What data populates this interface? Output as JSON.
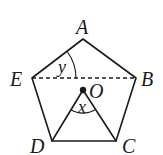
{
  "diagram": {
    "type": "geometry",
    "shape": "regular pentagon",
    "vertices": {
      "A": {
        "label": "A",
        "x": 83,
        "y": 39
      },
      "B": {
        "label": "B",
        "x": 136,
        "y": 78
      },
      "C": {
        "label": "C",
        "x": 116,
        "y": 141
      },
      "D": {
        "label": "D",
        "x": 52,
        "y": 141
      },
      "E": {
        "label": "E",
        "x": 32,
        "y": 78
      }
    },
    "center": {
      "label": "O",
      "x": 83,
      "y": 90
    },
    "segments": [
      {
        "from": "A",
        "to": "B",
        "style": "solid"
      },
      {
        "from": "B",
        "to": "C",
        "style": "solid"
      },
      {
        "from": "C",
        "to": "D",
        "style": "solid"
      },
      {
        "from": "D",
        "to": "E",
        "style": "solid"
      },
      {
        "from": "E",
        "to": "A",
        "style": "solid"
      },
      {
        "from": "E",
        "to": "B",
        "style": "dashed"
      },
      {
        "from": "O",
        "to": "D",
        "style": "solid"
      },
      {
        "from": "O",
        "to": "C",
        "style": "solid"
      }
    ],
    "angles": [
      {
        "label": "y",
        "vertex": "E",
        "between": [
          "A",
          "B"
        ]
      },
      {
        "label": "x",
        "vertex": "O",
        "between": [
          "D",
          "C"
        ]
      }
    ]
  }
}
